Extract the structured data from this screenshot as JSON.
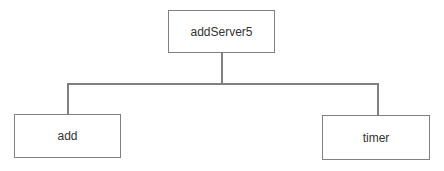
{
  "diagram": {
    "type": "tree",
    "root": {
      "label": "addServer5"
    },
    "children": [
      {
        "label": "add"
      },
      {
        "label": "timer"
      }
    ],
    "edges": [
      {
        "from": "addServer5",
        "to": "add"
      },
      {
        "from": "addServer5",
        "to": "timer"
      }
    ],
    "colors": {
      "border": "#808080",
      "text": "#333333",
      "background": "#ffffff"
    }
  }
}
